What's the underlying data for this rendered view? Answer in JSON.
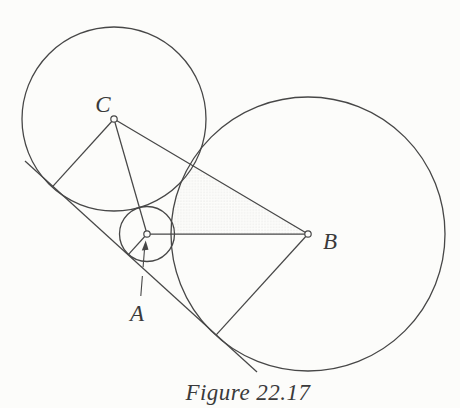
{
  "caption": "Figure 22.17",
  "labels": {
    "a": "A",
    "b": "B",
    "c": "C"
  },
  "colors": {
    "background": "#fcfcfa",
    "stroke": "#474747",
    "stipple": "#d6d6d4",
    "label": "#3a3a3a"
  },
  "geometry": {
    "circles": {
      "c": {
        "cx": 114,
        "cy": 119,
        "r": 92
      },
      "a": {
        "cx": 147,
        "cy": 234,
        "r": 27.5
      },
      "b": {
        "cx": 308,
        "cy": 234,
        "r": 137
      }
    },
    "tangent_line": {
      "x1": 25,
      "y1": 161,
      "x2": 257,
      "y2": 372
    },
    "segment_ca": {
      "x1": 114,
      "y1": 119,
      "x2": 147,
      "y2": 234
    },
    "segment_cb": {
      "x1": 114,
      "y1": 119,
      "x2": 308,
      "y2": 234
    },
    "segment_ab": {
      "x1": 147,
      "y1": 234,
      "x2": 308,
      "y2": 234
    },
    "radius_c_to_tangent": {
      "x1": 114,
      "y1": 119,
      "x2": 52.8,
      "y2": 186.3
    },
    "radius_a_to_tangent": {
      "x1": 147,
      "y1": 234,
      "x2": 128.1,
      "y2": 254.8
    },
    "radius_b_to_tangent": {
      "x1": 308,
      "y1": 234,
      "x2": 216.2,
      "y2": 334.9
    },
    "shaded_triangle_points": "114,119 147,234 308,234",
    "marker_radius": "3.2",
    "pointer_arrow": {
      "tail": {
        "x1": 140.8,
        "y1": 296,
        "x2": 144.6,
        "y2": 248
      },
      "dash": "20 9",
      "head_points": "145.7,240.6 141.8,250.5 148.5,249.8"
    },
    "label_pos": {
      "c": {
        "x": 103,
        "y": 112
      },
      "b": {
        "x": 330,
        "y": 249
      },
      "a": {
        "x": 137,
        "y": 321
      }
    },
    "caption_pos": {
      "x": 248,
      "y": 400
    }
  }
}
